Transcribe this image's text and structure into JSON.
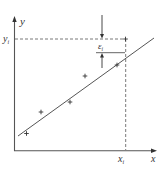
{
  "diagram": {
    "title": "",
    "type": "regression-residual",
    "colors": {
      "axis": "#555555",
      "line": "#555555",
      "dashed": "#555555",
      "marker": "#333333",
      "text": "#333333",
      "background": "#ffffff"
    },
    "labels": {
      "y_axis": "y",
      "x_axis": "x",
      "y_i": "y",
      "y_i_sub": "i",
      "x_i": "x",
      "x_i_sub": "i",
      "epsilon": "ε",
      "epsilon_sub": "i"
    },
    "data_points": [
      {
        "x": 26.5,
        "y": 133.5
      },
      {
        "x": 41,
        "y": 112
      },
      {
        "x": 70,
        "y": 102
      },
      {
        "x": 85,
        "y": 76
      },
      {
        "x": 117,
        "y": 65
      },
      {
        "x": 125.5,
        "y": 39
      }
    ],
    "regression_line": {
      "x1": 18,
      "y1": 136,
      "x2": 154,
      "y2": 38
    }
  }
}
